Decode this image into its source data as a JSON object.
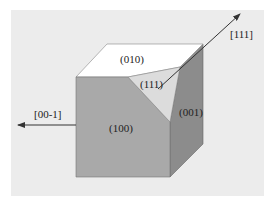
{
  "diagram": {
    "type": "crystal-cube-faces",
    "colors": {
      "page_background": "#ffffff",
      "panel_background": "#ececec",
      "front_face": "#a9a9a9",
      "top_face": "#ffffff",
      "right_face": "#8c8c8c",
      "cut_face_111": "#dcdcdc",
      "edge": "#555555",
      "arrow": "#333333"
    },
    "faces": [
      {
        "id": "front",
        "label": "(100)"
      },
      {
        "id": "top",
        "label": "(010)"
      },
      {
        "id": "right",
        "label": "(001)"
      },
      {
        "id": "cut",
        "label": "(111)"
      }
    ],
    "arrows": [
      {
        "id": "dir-111",
        "label": "[111]"
      },
      {
        "id": "dir-00-1",
        "label": "[00-1]"
      }
    ]
  }
}
